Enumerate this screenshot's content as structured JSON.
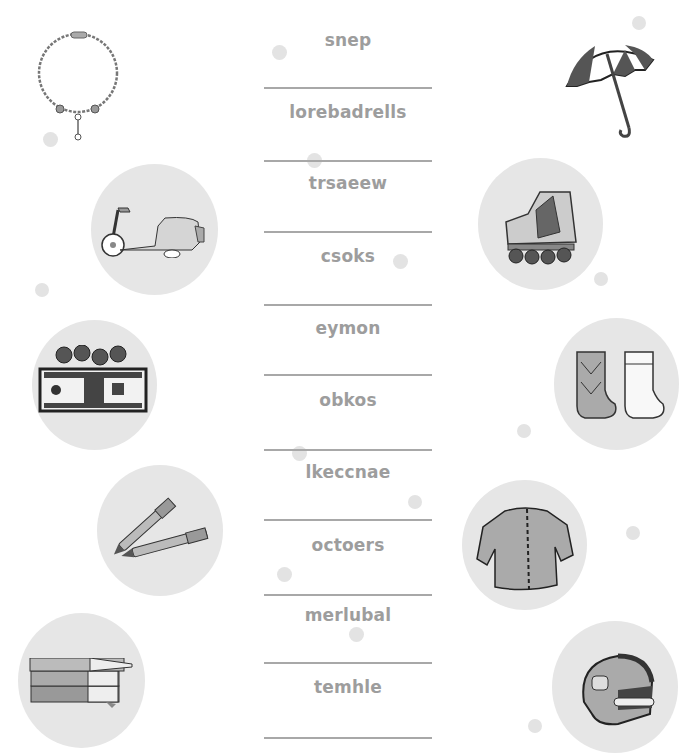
{
  "worksheet": {
    "scrambled_words": [
      {
        "word": "snep"
      },
      {
        "word": "lorebadrells"
      },
      {
        "word": "trsaeew"
      },
      {
        "word": "csoks"
      },
      {
        "word": "eymon"
      },
      {
        "word": "obkos"
      },
      {
        "word": "lkeccnae"
      },
      {
        "word": "octoers"
      },
      {
        "word": "merlubal"
      },
      {
        "word": "temhle"
      }
    ],
    "pictures_left": [
      "necklace",
      "scooter",
      "money",
      "pens",
      "books"
    ],
    "pictures_right": [
      "umbrella",
      "rollerblades",
      "socks",
      "sweater",
      "helmet"
    ],
    "colors": {
      "word_text": "#9d9d9d",
      "answer_line": "#a8a8a8",
      "circle_bg": "#e6e6e6"
    }
  }
}
